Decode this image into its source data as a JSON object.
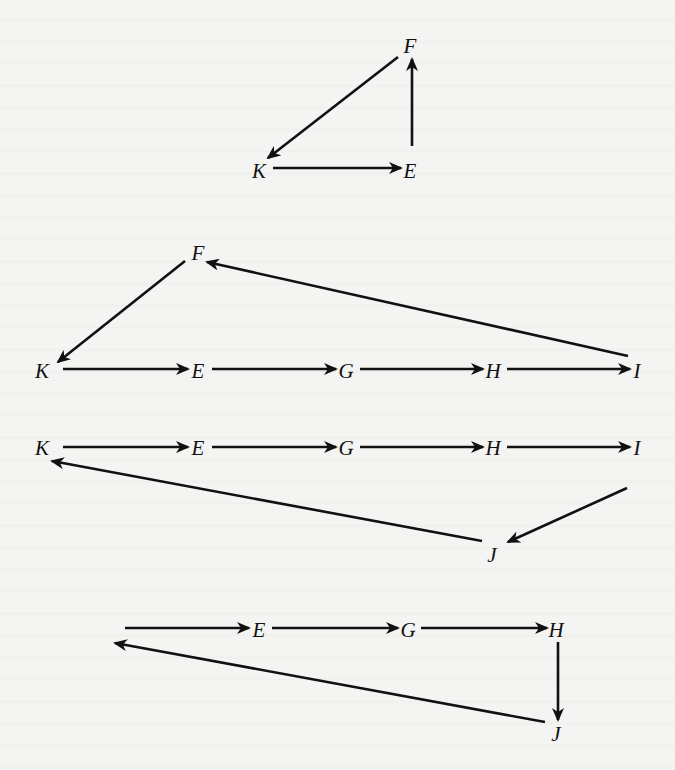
{
  "figure": {
    "background": "#f4f4f2",
    "stroke_color": "#111111",
    "diagrams": [
      {
        "id": "cycle-k-e-f",
        "nodes": [
          {
            "id": "F",
            "label": "F",
            "x": 410,
            "y": 46
          },
          {
            "id": "K",
            "label": "K",
            "x": 259,
            "y": 171
          },
          {
            "id": "E",
            "label": "E",
            "x": 410,
            "y": 171
          }
        ],
        "edges": [
          {
            "from": "F",
            "to": "K",
            "x1": 398,
            "y1": 57,
            "x2": 268,
            "y2": 158
          },
          {
            "from": "K",
            "to": "E",
            "x1": 273,
            "y1": 168,
            "x2": 401,
            "y2": 168
          },
          {
            "from": "E",
            "to": "F",
            "x1": 412,
            "y1": 146,
            "x2": 412,
            "y2": 59
          }
        ]
      },
      {
        "id": "cycle-k-e-g-h-i-f",
        "nodes": [
          {
            "id": "F",
            "label": "F",
            "x": 198,
            "y": 253
          },
          {
            "id": "K",
            "label": "K",
            "x": 42,
            "y": 371
          },
          {
            "id": "E",
            "label": "E",
            "x": 198,
            "y": 371
          },
          {
            "id": "G",
            "label": "G",
            "x": 346,
            "y": 371
          },
          {
            "id": "H",
            "label": "H",
            "x": 493,
            "y": 371
          },
          {
            "id": "I",
            "label": "I",
            "x": 637,
            "y": 371
          }
        ],
        "edges": [
          {
            "from": "F",
            "to": "K",
            "x1": 185,
            "y1": 261,
            "x2": 58,
            "y2": 362
          },
          {
            "from": "K",
            "to": "E",
            "x1": 63,
            "y1": 369,
            "x2": 188,
            "y2": 369
          },
          {
            "from": "E",
            "to": "G",
            "x1": 212,
            "y1": 369,
            "x2": 336,
            "y2": 369
          },
          {
            "from": "G",
            "to": "H",
            "x1": 360,
            "y1": 369,
            "x2": 483,
            "y2": 369
          },
          {
            "from": "H",
            "to": "I",
            "x1": 507,
            "y1": 369,
            "x2": 630,
            "y2": 369
          },
          {
            "from": "I",
            "to": "F",
            "x1": 628,
            "y1": 356,
            "x2": 207,
            "y2": 262
          }
        ]
      },
      {
        "id": "cycle-k-e-g-h-i-j",
        "nodes": [
          {
            "id": "K",
            "label": "K",
            "x": 42,
            "y": 448
          },
          {
            "id": "E",
            "label": "E",
            "x": 198,
            "y": 448
          },
          {
            "id": "G",
            "label": "G",
            "x": 346,
            "y": 448
          },
          {
            "id": "H",
            "label": "H",
            "x": 493,
            "y": 448
          },
          {
            "id": "I",
            "label": "I",
            "x": 637,
            "y": 448
          },
          {
            "id": "J",
            "label": "J",
            "x": 492,
            "y": 555
          }
        ],
        "edges": [
          {
            "from": "K",
            "to": "E",
            "x1": 63,
            "y1": 447,
            "x2": 188,
            "y2": 447
          },
          {
            "from": "E",
            "to": "G",
            "x1": 212,
            "y1": 447,
            "x2": 336,
            "y2": 447
          },
          {
            "from": "G",
            "to": "H",
            "x1": 360,
            "y1": 447,
            "x2": 483,
            "y2": 447
          },
          {
            "from": "H",
            "to": "I",
            "x1": 507,
            "y1": 447,
            "x2": 630,
            "y2": 447
          },
          {
            "from": "I",
            "to": "J",
            "x1": 627,
            "y1": 488,
            "x2": 508,
            "y2": 542
          },
          {
            "from": "J",
            "to": "K",
            "x1": 482,
            "y1": 541,
            "x2": 52,
            "y2": 461
          }
        ]
      },
      {
        "id": "cycle-e-g-h-j-open",
        "nodes": [
          {
            "id": "E",
            "label": "E",
            "x": 259,
            "y": 630
          },
          {
            "id": "G",
            "label": "G",
            "x": 408,
            "y": 630
          },
          {
            "id": "H",
            "label": "H",
            "x": 556,
            "y": 630
          },
          {
            "id": "J",
            "label": "J",
            "x": 556,
            "y": 734
          }
        ],
        "edges": [
          {
            "from": "start",
            "to": "E",
            "x1": 125,
            "y1": 628,
            "x2": 249,
            "y2": 628
          },
          {
            "from": "E",
            "to": "G",
            "x1": 272,
            "y1": 628,
            "x2": 398,
            "y2": 628
          },
          {
            "from": "G",
            "to": "H",
            "x1": 421,
            "y1": 628,
            "x2": 547,
            "y2": 628
          },
          {
            "from": "H",
            "to": "J",
            "x1": 558,
            "y1": 642,
            "x2": 558,
            "y2": 720
          },
          {
            "from": "J",
            "to": "start",
            "x1": 545,
            "y1": 722,
            "x2": 115,
            "y2": 643
          }
        ]
      }
    ]
  }
}
